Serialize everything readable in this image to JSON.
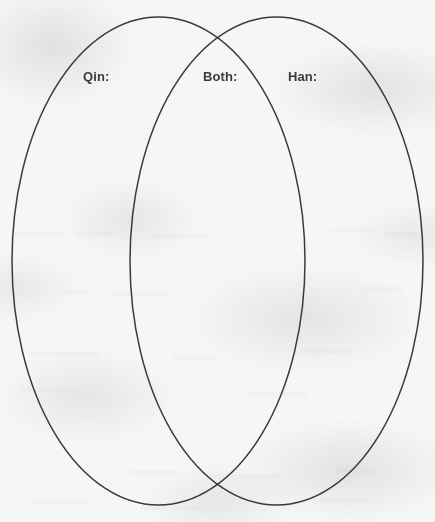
{
  "page": {
    "type": "venn-diagram-worksheet",
    "background_color": "#f6f6f5",
    "stroke_color": "#3a3a3a",
    "text_color": "#3b3b3b",
    "width": 435,
    "height": 522
  },
  "diagram": {
    "kind": "two-set-venn",
    "left_set": {
      "label": "Qin:",
      "center_x": 158.5,
      "center_y": 261,
      "radius_x": 146.5,
      "radius_y": 244,
      "contents": ""
    },
    "right_set": {
      "label": "Han:",
      "center_x": 276.5,
      "center_y": 261,
      "radius_x": 146.5,
      "radius_y": 244,
      "contents": ""
    },
    "intersection": {
      "label": "Both:",
      "contents": "",
      "upper_crossing_x": 217,
      "upper_crossing_y": 42,
      "lower_crossing_x": 217,
      "lower_crossing_y": 481
    }
  },
  "labels": {
    "left": "Qin:",
    "both": "Both:",
    "right": "Han:"
  }
}
